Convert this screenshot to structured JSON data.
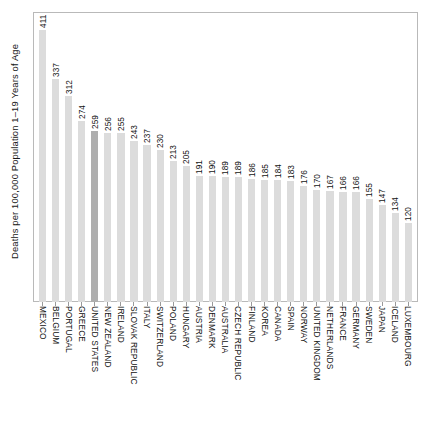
{
  "chart_data": {
    "type": "bar",
    "title": "",
    "subtitle": "",
    "xlabel": "",
    "ylabel": "Deaths per 100,000 Population 1–19 Years of Age",
    "ylim": [
      0,
      411
    ],
    "grid": false,
    "legend": "none",
    "orientation": "vertical",
    "value_labels": true,
    "value_label_rotation": 90,
    "category_label_rotation": 90,
    "axis_tick_labels": [],
    "colors": {
      "bar": "#dcdcdc",
      "bar_highlight": "#aeaeae",
      "frame": "#b9b9b9",
      "text": "#141414",
      "background": "#ffffff"
    },
    "highlight_category": "UNITED STATES",
    "categories": [
      "MEXICO",
      "BELGIUM",
      "PORTUGAL",
      "GREECE",
      "UNITED STATES",
      "NEW ZEALAND",
      "IRELAND",
      "SLOVAK REPUBLIC",
      "ITALY",
      "SWITZERLAND",
      "POLAND",
      "HUNGARY",
      "AUSTRIA",
      "DENMARK",
      "AUSTRALIA",
      "CZECH REPUBLIC",
      "FINLAND",
      "KOREA",
      "CANADA",
      "SPAIN",
      "NORWAY",
      "UNITED KINGDOM",
      "NETHERLANDS",
      "FRANCE",
      "GERMANY",
      "SWEDEN",
      "JAPAN",
      "ICELAND",
      "LUXEMBOURG"
    ],
    "values": [
      411,
      337,
      312,
      274,
      259,
      256,
      255,
      243,
      237,
      230,
      213,
      205,
      191,
      190,
      189,
      189,
      186,
      185,
      184,
      183,
      176,
      170,
      167,
      166,
      166,
      155,
      147,
      134,
      120
    ]
  }
}
